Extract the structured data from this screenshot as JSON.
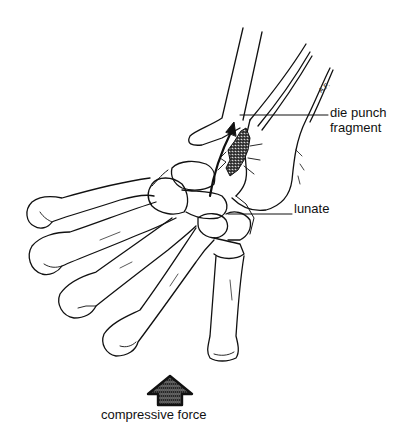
{
  "figure": {
    "labels": {
      "die_punch_line1": "die punch",
      "die_punch_line2": "fragment",
      "lunate": "lunate",
      "force": "compressive force"
    },
    "artist_initials": "A.F.",
    "icons": {
      "force_arrow": "up-arrow-icon",
      "fracture_arrow": "diagonal-arrow-icon"
    },
    "colors": {
      "line": "#111111",
      "background": "#ffffff",
      "stipple": "#888888"
    }
  }
}
